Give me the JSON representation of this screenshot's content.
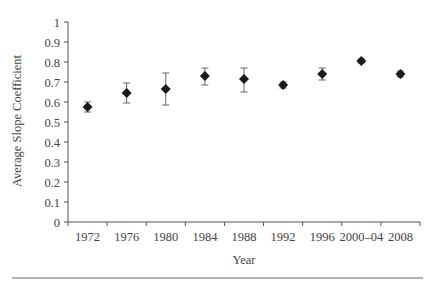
{
  "chart_data": {
    "type": "scatter",
    "title": "",
    "xlabel": "Year",
    "ylabel": "Average Slope Coefficient",
    "ylim": [
      0,
      1
    ],
    "yticks": [
      0,
      0.1,
      0.2,
      0.3,
      0.4,
      0.5,
      0.6,
      0.7,
      0.8,
      0.9,
      1
    ],
    "ytick_labels": [
      "0",
      "0.1",
      "0.2",
      "0.3",
      "0.4",
      "0.5",
      "0.6",
      "0.7",
      "0.8",
      "0.9",
      "1"
    ],
    "categories": [
      "1972",
      "1976",
      "1980",
      "1984",
      "1988",
      "1992",
      "1996",
      "2000–04",
      "2008"
    ],
    "grid": false,
    "legend": null,
    "marker": "diamond",
    "series": [
      {
        "name": "Average Slope Coefficient",
        "color": "#1a1a1a",
        "values": [
          0.575,
          0.645,
          0.665,
          0.73,
          0.715,
          0.685,
          0.74,
          0.805,
          0.74
        ],
        "error_low": [
          0.55,
          0.595,
          0.585,
          0.685,
          0.65,
          0.67,
          0.71,
          0.795,
          0.725
        ],
        "error_high": [
          0.6,
          0.695,
          0.745,
          0.77,
          0.77,
          0.7,
          0.77,
          0.815,
          0.755
        ]
      }
    ]
  }
}
